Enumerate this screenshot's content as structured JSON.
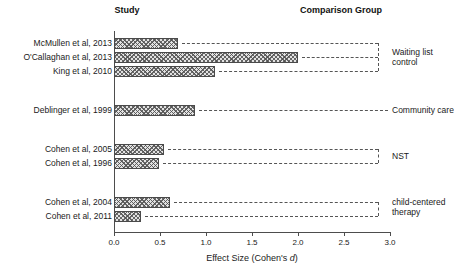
{
  "headers": {
    "study": "Study",
    "comparison": "Comparison Group"
  },
  "axis": {
    "title_prefix": "Effect Size (Cohen's ",
    "title_italic": "d",
    "title_suffix": ")",
    "ticks": [
      "0.0",
      "0.5",
      "1.0",
      "1.5",
      "2.0",
      "2.5",
      "3.0"
    ]
  },
  "groups": [
    {
      "label_line1": "Waiting list",
      "label_line2": "control"
    },
    {
      "label_line1": "Community care",
      "label_line2": ""
    },
    {
      "label_line1": "NST",
      "label_line2": ""
    },
    {
      "label_line1": "child-centered",
      "label_line2": "therapy"
    }
  ],
  "studies": [
    {
      "label": "McMullen et al, 2013"
    },
    {
      "label": "O'Callaghan et al, 2013"
    },
    {
      "label": "King et al, 2010"
    },
    {
      "label": "Deblinger et al, 1999"
    },
    {
      "label": "Cohen et al, 2005"
    },
    {
      "label": "Cohen et al, 1996"
    },
    {
      "label": "Cohen et al, 2004"
    },
    {
      "label": "Cohen et al, 2011"
    }
  ],
  "chart_data": {
    "type": "bar",
    "orientation": "horizontal",
    "title": "",
    "xlabel": "Effect Size (Cohen's d)",
    "ylabel": "Study",
    "xlim": [
      0.0,
      3.0
    ],
    "xticks": [
      0.0,
      0.5,
      1.0,
      1.5,
      2.0,
      2.5,
      3.0
    ],
    "grid": false,
    "legend": "none",
    "categories": [
      "McMullen et al, 2013",
      "O'Callaghan et al, 2013",
      "King et al, 2010",
      "Deblinger et al, 1999",
      "Cohen et al, 2005",
      "Cohen et al, 1996",
      "Cohen et al, 2004",
      "Cohen et al, 2011"
    ],
    "values": [
      0.7,
      2.0,
      1.1,
      0.88,
      0.54,
      0.49,
      0.61,
      0.29
    ],
    "comparison_groups": [
      {
        "name": "Waiting list control",
        "studies": [
          "McMullen et al, 2013",
          "O'Callaghan et al, 2013",
          "King et al, 2010"
        ]
      },
      {
        "name": "Community care",
        "studies": [
          "Deblinger et al, 1999"
        ]
      },
      {
        "name": "NST",
        "studies": [
          "Cohen et al, 2005",
          "Cohen et al, 1996"
        ]
      },
      {
        "name": "child-centered therapy",
        "studies": [
          "Cohen et al, 2004",
          "Cohen et al, 2011"
        ]
      }
    ],
    "colors": {
      "bar_fill": "#e2e2e2",
      "bar_edge": "#4a4a4a",
      "axis": "#4d4d4d",
      "text": "#1a1a1a"
    }
  }
}
